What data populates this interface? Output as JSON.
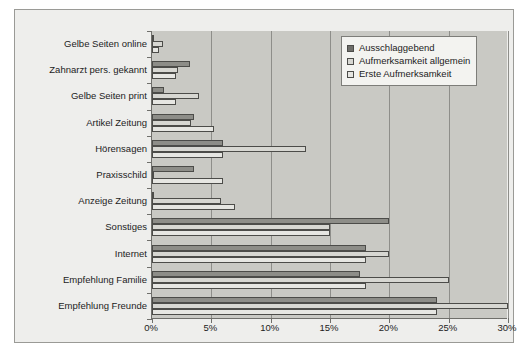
{
  "chart_data": {
    "type": "bar",
    "orientation": "horizontal",
    "title": "",
    "subtitle": "",
    "xlabel": "",
    "ylabel": "",
    "xlim": [
      0,
      30
    ],
    "xticks": [
      0,
      5,
      10,
      15,
      20,
      25,
      30
    ],
    "xtick_labels": [
      "0%",
      "5%",
      "10%",
      "15%",
      "20%",
      "25%",
      "30%"
    ],
    "grid": true,
    "grid_axis": "x",
    "legend_position": "top-right",
    "categories": [
      "Gelbe Seiten online",
      "Zahnarzt pers. gekannt",
      "Gelbe Seiten print",
      "Artikel Zeitung",
      "Hörensagen",
      "Praxisschild",
      "Anzeige Zeitung",
      "Sonstiges",
      "Internet",
      "Empfehlung Familie",
      "Empfehlung Freunde"
    ],
    "series": [
      {
        "name": "Ausschlaggebend",
        "color": "#8d8d88",
        "values": [
          0.0,
          3.2,
          1.0,
          3.5,
          6.0,
          3.5,
          0.2,
          20.0,
          18.0,
          17.5,
          24.0
        ]
      },
      {
        "name": "Aufmerksamkeit allgemein",
        "color": "#d7d7d2",
        "values": [
          0.9,
          2.2,
          4.0,
          3.3,
          13.0,
          0.2,
          5.8,
          15.0,
          20.0,
          25.0,
          30.0
        ]
      },
      {
        "name": "Erste Aufmerksamkeit",
        "color": "#e6e6e2",
        "values": [
          0.6,
          2.0,
          2.0,
          5.2,
          6.0,
          6.0,
          7.0,
          15.0,
          18.0,
          18.0,
          24.0
        ]
      }
    ]
  },
  "legend": {
    "items": [
      {
        "label": "Ausschlaggebend",
        "swatch": "legend-swatch-dark"
      },
      {
        "label": "Aufmerksamkeit allgemein",
        "swatch": "legend-swatch-mid"
      },
      {
        "label": "Erste Aufmerksamkeit",
        "swatch": "legend-swatch-light"
      }
    ]
  }
}
